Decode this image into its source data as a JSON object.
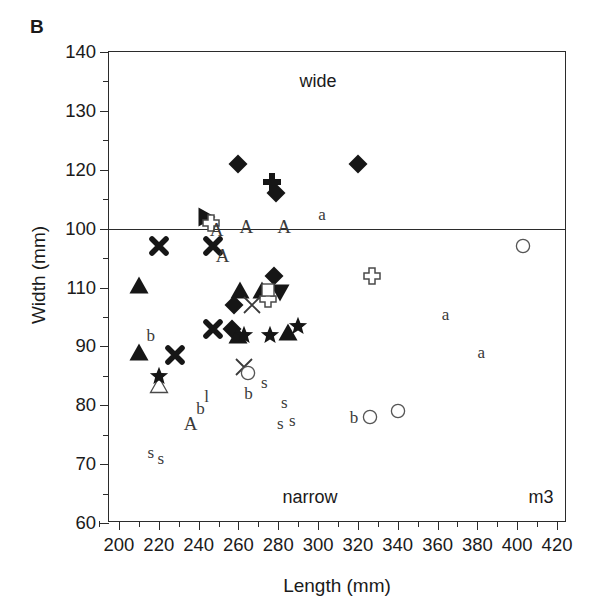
{
  "panel": {
    "letter": "B"
  },
  "axes": {
    "xlabel": "Length (mm)",
    "ylabel": "Width (mm)",
    "x_ticks": [
      "200",
      "220",
      "240",
      "260",
      "280",
      "300",
      "320",
      "340",
      "360",
      "380",
      "400",
      "420"
    ],
    "y_ticks": [
      "140",
      "130",
      "120",
      "100",
      "110",
      "90",
      "80",
      "70",
      "60"
    ],
    "xlim": [
      195,
      425
    ],
    "ylim": [
      60,
      140
    ],
    "xtick_values": [
      200,
      220,
      240,
      260,
      280,
      300,
      320,
      340,
      360,
      380,
      400,
      420
    ],
    "ytick_values": [
      140,
      130,
      120,
      110,
      100,
      90,
      80,
      70,
      60
    ]
  },
  "annotations": [
    {
      "name": "wide-label",
      "text": "wide",
      "x": 300,
      "y": 135
    },
    {
      "name": "narrow-label",
      "text": "narrow",
      "x": 296,
      "y": 64.5
    },
    {
      "name": "m3-label",
      "text": "m3",
      "x": 412,
      "y": 64.5
    }
  ],
  "divider": {
    "y": 110
  },
  "chart_data": {
    "type": "scatter",
    "title": "B",
    "xlabel": "Length (mm)",
    "ylabel": "Width (mm)",
    "xlim": [
      195,
      425
    ],
    "ylim": [
      60,
      140
    ],
    "grid": false,
    "legend": false,
    "reference_line": {
      "axis": "y",
      "value": 110,
      "upper_label": "wide",
      "lower_label": "narrow"
    },
    "corner_label": "m3",
    "series": [
      {
        "name": "filled-diamond",
        "marker": "diamond-filled",
        "points": [
          [
            260,
            121.0
          ],
          [
            320,
            121.0
          ],
          [
            279,
            116.0
          ],
          [
            278,
            102.0
          ],
          [
            258,
            97.0
          ],
          [
            257,
            93.0
          ]
        ]
      },
      {
        "name": "filled-up-triangle",
        "marker": "triangle-up-filled",
        "points": [
          [
            210,
            100.5
          ],
          [
            261,
            99.5
          ],
          [
            272,
            99.5
          ],
          [
            260,
            92.0
          ],
          [
            285,
            92.5
          ],
          [
            210,
            89.0
          ]
        ]
      },
      {
        "name": "filled-down-triangle",
        "marker": "triangle-down-filled",
        "points": [
          [
            281,
            99.0
          ]
        ]
      },
      {
        "name": "filled-right-triangle",
        "marker": "triangle-right-filled",
        "points": [
          [
            244,
            112.0
          ]
        ]
      },
      {
        "name": "open-triangle",
        "marker": "triangle-up-open",
        "points": [
          [
            220,
            83.5
          ]
        ]
      },
      {
        "name": "filled-cross-plus",
        "marker": "cross-plus-filled",
        "points": [
          [
            277,
            118.0
          ]
        ]
      },
      {
        "name": "open-cross-plus",
        "marker": "cross-plus-open",
        "points": [
          [
            246,
            111.0
          ],
          [
            275,
            98.0
          ],
          [
            327,
            102.0
          ]
        ]
      },
      {
        "name": "open-square",
        "marker": "square-open",
        "points": [
          [
            275,
            99.5
          ]
        ]
      },
      {
        "name": "x-thin",
        "marker": "x-thin",
        "points": [
          [
            267,
            97.0
          ],
          [
            263,
            86.5
          ]
        ]
      },
      {
        "name": "x-bold",
        "marker": "x-bold",
        "points": [
          [
            220,
            107.0
          ],
          [
            247,
            107.0
          ],
          [
            247,
            93.0
          ],
          [
            228,
            88.5
          ]
        ]
      },
      {
        "name": "filled-star",
        "marker": "star-filled",
        "points": [
          [
            263,
            92.0
          ],
          [
            276,
            92.0
          ],
          [
            290,
            93.5
          ],
          [
            220,
            85.0
          ]
        ]
      },
      {
        "name": "open-circle",
        "marker": "circle-open",
        "points": [
          [
            403,
            107.0
          ],
          [
            265,
            85.5
          ],
          [
            326,
            78.0
          ],
          [
            340,
            79.0
          ]
        ]
      }
    ],
    "text_markers": [
      {
        "label": "A",
        "x": 264,
        "y": 110.5
      },
      {
        "label": "A",
        "x": 283,
        "y": 110.5
      },
      {
        "label": "A",
        "x": 249,
        "y": 110.0
      },
      {
        "label": "a",
        "x": 302,
        "y": 112.5
      },
      {
        "label": "A",
        "x": 252,
        "y": 105.5
      },
      {
        "label": "b",
        "x": 216,
        "y": 92.0
      },
      {
        "label": "a",
        "x": 364,
        "y": 95.5
      },
      {
        "label": "a",
        "x": 382,
        "y": 89.0
      },
      {
        "label": "s",
        "x": 273,
        "y": 84.0
      },
      {
        "label": "b",
        "x": 265,
        "y": 82.0
      },
      {
        "label": "l",
        "x": 244,
        "y": 81.5
      },
      {
        "label": "b",
        "x": 241,
        "y": 79.5
      },
      {
        "label": "s",
        "x": 283,
        "y": 80.5
      },
      {
        "label": "A",
        "x": 236,
        "y": 77.0
      },
      {
        "label": "s",
        "x": 281,
        "y": 77.0
      },
      {
        "label": "s",
        "x": 287,
        "y": 77.5
      },
      {
        "label": "b",
        "x": 318,
        "y": 78.0
      },
      {
        "label": "s",
        "x": 216,
        "y": 72.0
      },
      {
        "label": "s",
        "x": 221,
        "y": 71.0
      }
    ]
  },
  "colors": {
    "ink": "#1a1a1a",
    "axis": "#2b2b2b",
    "marker": "#161616",
    "text_marker": "#3a3a3a",
    "background": "#ffffff"
  }
}
